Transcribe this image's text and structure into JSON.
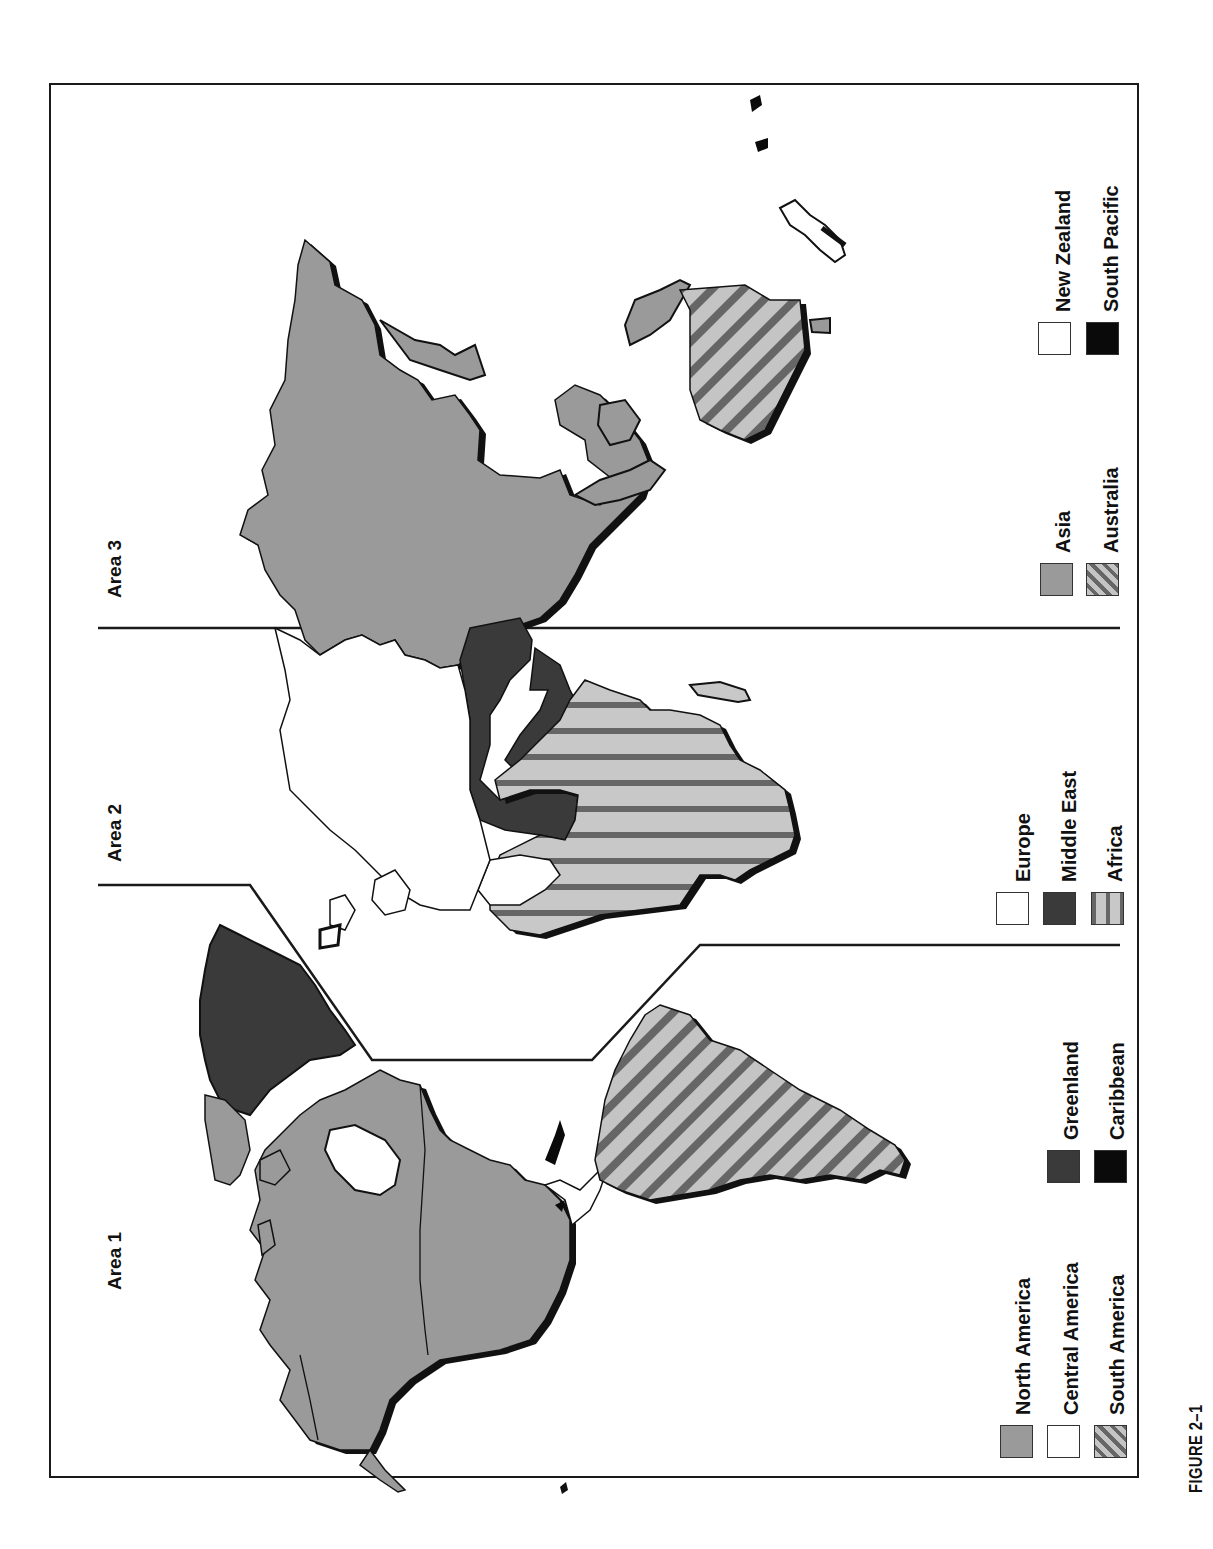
{
  "figure": {
    "caption": "FIGURE 2–1",
    "orientation": "rotated 90° counter-clockwise"
  },
  "areas": [
    {
      "id": "area1",
      "label": "Area 1"
    },
    {
      "id": "area2",
      "label": "Area 2"
    },
    {
      "id": "area3",
      "label": "Area 3"
    }
  ],
  "legend": {
    "area1": [
      {
        "label": "North America",
        "pattern": "solid-gray",
        "color": "#9a9a9a"
      },
      {
        "label": "Central America",
        "pattern": "white",
        "color": "#ffffff"
      },
      {
        "label": "South America",
        "pattern": "diagonal-stripes",
        "color": "#c4c4c4"
      },
      {
        "label": "Greenland",
        "pattern": "dark-gray",
        "color": "#3a3a3a"
      },
      {
        "label": "Caribbean",
        "pattern": "black",
        "color": "#0a0a0a"
      }
    ],
    "area2": [
      {
        "label": "Europe",
        "pattern": "white",
        "color": "#ffffff"
      },
      {
        "label": "Middle East",
        "pattern": "dark-gray",
        "color": "#3a3a3a"
      },
      {
        "label": "Africa",
        "pattern": "vertical-stripes",
        "color": "#c8c8c8"
      }
    ],
    "area3": [
      {
        "label": "Asia",
        "pattern": "solid-gray",
        "color": "#9a9a9a"
      },
      {
        "label": "Australia",
        "pattern": "diagonal-stripes",
        "color": "#c4c4c4"
      },
      {
        "label": "New Zealand",
        "pattern": "white",
        "color": "#ffffff"
      },
      {
        "label": "South Pacific",
        "pattern": "black",
        "color": "#0a0a0a"
      }
    ]
  },
  "colors": {
    "frame": "#1a1a1a",
    "land_gray": "#9a9a9a",
    "land_dark": "#3a3a3a",
    "shadow": "#111111",
    "stripe_light": "#c4c4c4",
    "stripe_dark": "#666666"
  }
}
